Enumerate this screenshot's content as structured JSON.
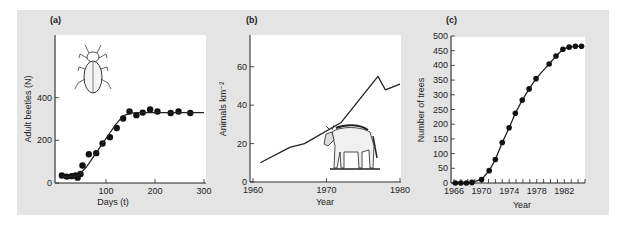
{
  "chart_data": [
    {
      "panel": "(a)",
      "type": "scatter",
      "title": "",
      "xlabel": "Days (t)",
      "ylabel": "Adult beetles (N)",
      "xlim": [
        0,
        300
      ],
      "ylim": [
        0,
        600
      ],
      "xticks": [
        100,
        200,
        300
      ],
      "yticks": [
        0,
        200,
        400
      ],
      "xtick_labels": [
        "100",
        "200",
        "300"
      ],
      "ytick_labels": [
        "0",
        "200",
        "400"
      ],
      "grid": false,
      "illustration": "beetle",
      "series": [
        {
          "name": "observed",
          "kind": "points",
          "x": [
            10,
            20,
            30,
            38,
            42,
            48,
            52,
            65,
            80,
            93,
            108,
            122,
            135,
            148,
            162,
            175,
            190,
            205,
            232,
            248,
            272
          ],
          "y": [
            35,
            30,
            32,
            35,
            25,
            42,
            82,
            135,
            140,
            185,
            215,
            258,
            302,
            335,
            318,
            330,
            345,
            335,
            328,
            335,
            328
          ]
        },
        {
          "name": "logistic fit",
          "kind": "line",
          "x": [
            10,
            30,
            45,
            60,
            75,
            90,
            105,
            120,
            135,
            150,
            170,
            200,
            250,
            300
          ],
          "y": [
            30,
            30,
            38,
            75,
            125,
            175,
            225,
            275,
            315,
            328,
            330,
            330,
            330,
            330
          ]
        }
      ]
    },
    {
      "panel": "(b)",
      "type": "line",
      "title": "",
      "xlabel": "Year",
      "ylabel": "Animals km⁻²",
      "xlim": [
        1960,
        1980
      ],
      "ylim": [
        0,
        76
      ],
      "xticks": [
        1960,
        1970,
        1980
      ],
      "yticks": [
        0,
        20,
        40,
        60
      ],
      "xtick_labels": [
        "1960",
        "1970",
        "1980"
      ],
      "ytick_labels": [
        "0",
        "20",
        "40",
        "60"
      ],
      "grid": false,
      "illustration": "wildebeest",
      "series": [
        {
          "name": "wildebeest density",
          "x": [
            1961,
            1965,
            1967,
            1972,
            1977,
            1978,
            1980
          ],
          "y": [
            10,
            18,
            20,
            31,
            55,
            48,
            51
          ]
        }
      ]
    },
    {
      "panel": "(c)",
      "type": "line",
      "title": "",
      "xlabel": "Year",
      "ylabel": "Number of trees",
      "xlim": [
        1966,
        1985
      ],
      "ylim": [
        0,
        500
      ],
      "xticks": [
        1966,
        1967,
        1968,
        1969,
        1970,
        1971,
        1972,
        1973,
        1974,
        1975,
        1976,
        1977,
        1978,
        1979,
        1980,
        1981,
        1982,
        1983,
        1984,
        1985
      ],
      "xtick_labels": [
        "1966",
        "1970",
        "1974",
        "1978",
        "1982"
      ],
      "xtick_label_values": [
        1966,
        1970,
        1974,
        1978,
        1982
      ],
      "yticks": [
        0,
        50,
        100,
        150,
        200,
        250,
        300,
        350,
        400,
        450,
        500
      ],
      "ytick_labels": [
        "0",
        "50",
        "100",
        "150",
        "200",
        "250",
        "300",
        "350",
        "400",
        "450",
        "500"
      ],
      "grid": false,
      "series": [
        {
          "name": "trees",
          "kind": "points+line",
          "x": [
            1966.2,
            1967,
            1967.8,
            1968.6,
            1970,
            1971.1,
            1972,
            1973,
            1974,
            1974.9,
            1975.9,
            1976.9,
            1977.9,
            1979.8,
            1980.8,
            1981.8,
            1982.7,
            1983.6,
            1984.5
          ],
          "y": [
            0,
            0,
            0,
            2,
            12,
            42,
            80,
            138,
            188,
            237,
            282,
            320,
            355,
            405,
            432,
            455,
            462,
            465,
            465
          ]
        }
      ]
    }
  ],
  "panels": {
    "a": {
      "letter": "(a)",
      "xlabel": "Days (t)",
      "ylabel": "Adult beetles (N)"
    },
    "b": {
      "letter": "(b)",
      "xlabel": "Year",
      "ylabel": "Animals km⁻²"
    },
    "c": {
      "letter": "(c)",
      "xlabel": "Year",
      "ylabel": "Number of trees"
    }
  }
}
